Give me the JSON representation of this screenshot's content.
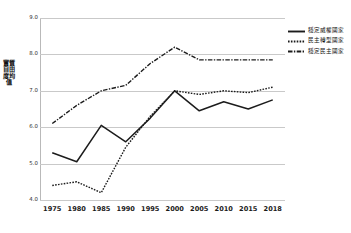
{
  "chart_data": {
    "type": "line",
    "title": "",
    "xlabel": "",
    "ylabel": "實質自由度均值",
    "categories": [
      "1975",
      "1980",
      "1985",
      "1990",
      "1995",
      "2000",
      "2005",
      "2010",
      "2015",
      "2018"
    ],
    "ylim": [
      4.0,
      9.0
    ],
    "yticks": [
      "9.0",
      "8.0",
      "7.0",
      "6.0",
      "5.0",
      "4.0"
    ],
    "ytick_values": [
      9.0,
      8.0,
      7.0,
      6.0,
      5.0,
      4.0
    ],
    "grid": true,
    "legend_position": "top-right",
    "series": [
      {
        "name": "穩定威權國家",
        "style": "solid",
        "color": "#1c1c1c",
        "values": [
          5.3,
          5.05,
          6.05,
          5.6,
          6.25,
          7.0,
          6.45,
          6.7,
          6.5,
          6.75
        ]
      },
      {
        "name": "民主轉型國家",
        "style": "dotted",
        "color": "#1c1c1c",
        "values": [
          4.4,
          4.5,
          4.2,
          5.45,
          6.3,
          7.0,
          6.9,
          7.0,
          6.95,
          7.1
        ]
      },
      {
        "name": "穩定民主國家",
        "style": "dashdot",
        "color": "#1c1c1c",
        "values": [
          6.1,
          6.6,
          7.0,
          7.15,
          7.75,
          8.2,
          7.85,
          7.85,
          7.85,
          7.85
        ]
      }
    ]
  },
  "legend": {
    "items": [
      {
        "label": "穩定威權國家"
      },
      {
        "label": "民主轉型國家"
      },
      {
        "label": "穩定民主國家"
      }
    ]
  }
}
